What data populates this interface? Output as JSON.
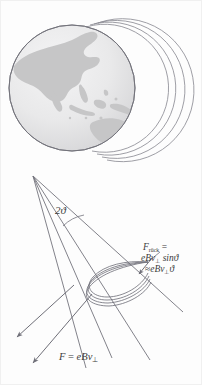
{
  "figure": {
    "background_color": "#fdfdfd",
    "ink_color": "#6f6f78",
    "globe": {
      "ocean_color": "#e9e9ea",
      "land_color": "#c9c9c9",
      "outline_color": "#7a7a82",
      "center_x": 72,
      "center_y": 88,
      "radius": 63,
      "visible_landmasses": "Asia, Southeast Asia, Indonesia, Australia, New Guinea"
    },
    "field_arcs": {
      "count": 4,
      "color": "#8a8a92",
      "description": "concentric arcs offset to the right of the globe"
    },
    "cone": {
      "apex_x": 33,
      "apex_y": 176,
      "ray_count": 4,
      "angle_arc_color": "#7a7a82"
    },
    "spiral": {
      "loop_count": 4,
      "node_x": 148,
      "node_y": 262,
      "description": "helical gyration loops converging at the mirror node"
    }
  },
  "labels": {
    "angle": {
      "text": "2",
      "symbol": "ϑ",
      "full": "2ϑ",
      "meaning": "cone half-angle doubled"
    },
    "force_restoring": {
      "line1_main": "F",
      "line1_sub": "rück",
      "line1_eq": " =",
      "line2": "eBv",
      "line2_sub": "⊥",
      "line2_tail": " sinϑ",
      "line3_approx": "≈",
      "line3_main": "eBv",
      "line3_sub": "⊥",
      "line3_tail": "ϑ",
      "full": "F_rück = eBv⊥ sinϑ ≈ eBv⊥ϑ"
    },
    "force_lorentz": {
      "main": "F",
      "eq": " = ",
      "expr": "eBv",
      "sub": "⊥",
      "full": "F = eBv⊥"
    }
  },
  "arrows": {
    "restoring_arrow": {
      "name": "restoring-force-arrow",
      "direction": "down-left",
      "from_x": 151,
      "from_y": 259,
      "to_x": 139,
      "to_y": 274
    },
    "lorentz_arrow_upper": {
      "name": "lorentz-force-arrow-upper",
      "direction": "down-left",
      "to_x": 17,
      "to_y": 337
    },
    "lorentz_arrow_lower": {
      "name": "lorentz-force-arrow-lower",
      "direction": "down-left",
      "to_x": 33,
      "to_y": 363
    }
  }
}
